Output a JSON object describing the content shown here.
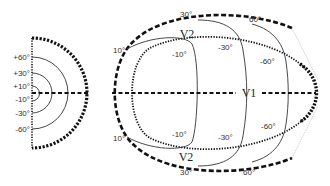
{
  "left_map": {
    "labels": {
      "p60": "+60°",
      "p30": "+30°",
      "p10": "+10°",
      "m10": "-10°",
      "m30": "-30°",
      "m60": "-60°"
    }
  },
  "right_map": {
    "areas": {
      "v1": "V1",
      "v2_top": "V2",
      "v2_bottom": "V2"
    },
    "eccentricity_labels": {
      "top_10": "10°",
      "top_30": "30°",
      "top_60": "60°",
      "bottom_10": "10°",
      "bottom_30": "30°",
      "bottom_60": "60°"
    },
    "polar_labels": {
      "top_m10": "-10°",
      "top_m30": "-30°",
      "top_m60": "-60°",
      "bottom_m10": "-10°",
      "bottom_m30": "-30°",
      "bottom_m60": "-60°"
    }
  },
  "colors": {
    "line": "#111111",
    "thin_line": "#333333",
    "faint_line": "#999999",
    "background": "#ffffff"
  }
}
